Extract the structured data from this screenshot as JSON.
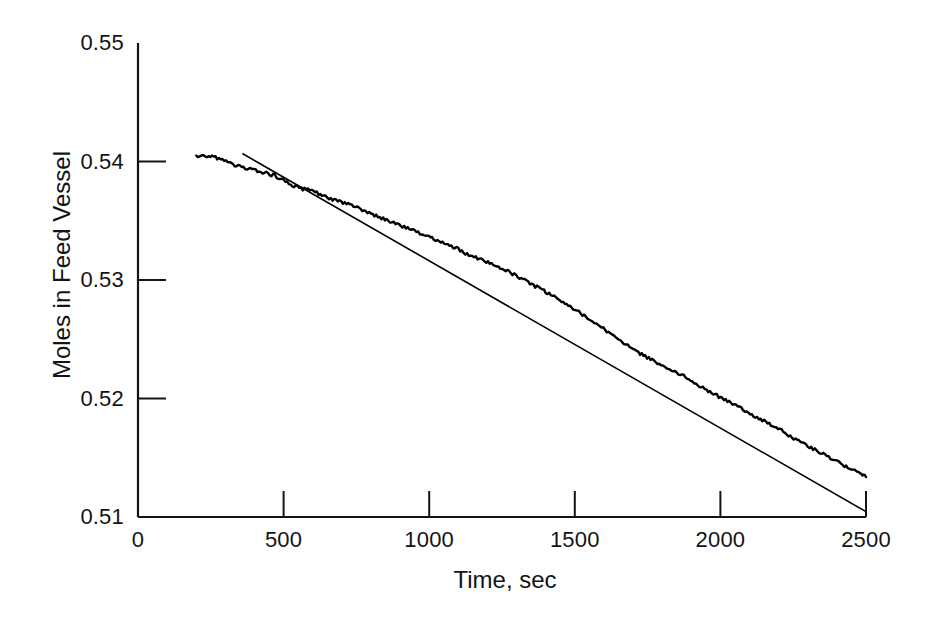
{
  "chart_data": {
    "type": "line",
    "title": "",
    "xlabel": "Time, sec",
    "ylabel": "Moles in Feed Vessel",
    "xlim": [
      0,
      2500
    ],
    "ylim": [
      0.51,
      0.55
    ],
    "xticks": [
      0,
      500,
      1000,
      1500,
      2000,
      2500
    ],
    "xticklabels": [
      "0",
      "500",
      "1000",
      "1500",
      "2000",
      "2500"
    ],
    "yticks": [
      0.51,
      0.52,
      0.53,
      0.54,
      0.55
    ],
    "yticklabels": [
      "0.51",
      "0.52",
      "0.53",
      "0.54",
      "0.55"
    ],
    "grid": false,
    "legend": "none",
    "spines": [
      "left",
      "bottom"
    ],
    "line_color": "#000000",
    "series": [
      {
        "name": "measured-moles",
        "style": "noisy-experimental-trace",
        "x": [
          200,
          230,
          260,
          290,
          320,
          350,
          380,
          410,
          440,
          470,
          500,
          530,
          560,
          590,
          620,
          650,
          680,
          710,
          740,
          770,
          800,
          830,
          860,
          890,
          920,
          950,
          980,
          1010,
          1040,
          1070,
          1100,
          1130,
          1160,
          1190,
          1220,
          1250,
          1280,
          1310,
          1340,
          1370,
          1400,
          1430,
          1460,
          1490,
          1520,
          1550,
          1580,
          1610,
          1640,
          1670,
          1700,
          1730,
          1760,
          1790,
          1820,
          1850,
          1880,
          1910,
          1940,
          1970,
          2000,
          2030,
          2060,
          2090,
          2120,
          2150,
          2180,
          2210,
          2240,
          2270,
          2300,
          2330,
          2360,
          2390,
          2420,
          2450,
          2480,
          2500
        ],
        "y": [
          0.5405,
          0.5405,
          0.5404,
          0.5401,
          0.5398,
          0.5396,
          0.5394,
          0.5392,
          0.539,
          0.5388,
          0.5384,
          0.538,
          0.5377,
          0.5376,
          0.5373,
          0.537,
          0.5367,
          0.5365,
          0.5362,
          0.5359,
          0.5356,
          0.5353,
          0.535,
          0.5347,
          0.5344,
          0.5341,
          0.5338,
          0.5335,
          0.5332,
          0.5329,
          0.5326,
          0.5322,
          0.5319,
          0.5316,
          0.5313,
          0.531,
          0.5306,
          0.5302,
          0.5298,
          0.5294,
          0.529,
          0.5286,
          0.5281,
          0.5277,
          0.5272,
          0.5267,
          0.5262,
          0.5257,
          0.5252,
          0.5247,
          0.5242,
          0.5237,
          0.5233,
          0.5229,
          0.5226,
          0.5222,
          0.5218,
          0.5213,
          0.5209,
          0.5205,
          0.5201,
          0.5197,
          0.5193,
          0.5189,
          0.5185,
          0.5181,
          0.5177,
          0.5173,
          0.5168,
          0.5164,
          0.516,
          0.5156,
          0.5152,
          0.5148,
          0.5144,
          0.514,
          0.5137,
          0.5135
        ]
      },
      {
        "name": "linear-fit",
        "style": "straight-regression-line",
        "x": [
          360,
          2500
        ],
        "y": [
          0.54065,
          0.51045
        ]
      }
    ]
  },
  "axis": {
    "x_title": "Time, sec",
    "y_title": "Moles in Feed Vessel",
    "x_tick_labels": [
      "0",
      "500",
      "1000",
      "1500",
      "2000",
      "2500"
    ],
    "y_tick_labels": [
      "0.55",
      "0.54",
      "0.53",
      "0.52",
      "0.51"
    ]
  },
  "colors": {
    "background": "#ffffff",
    "ink": "#141414",
    "curve": "#000000"
  }
}
